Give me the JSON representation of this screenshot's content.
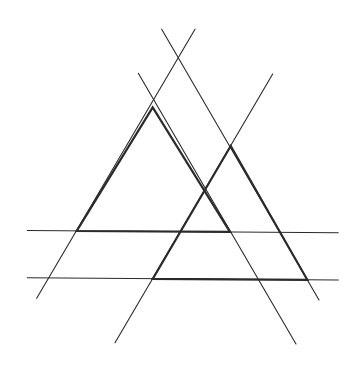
{
  "diagram": {
    "background": "#ffffff",
    "stroke_color": "#2b2b2b",
    "thin_width": 1.1,
    "thick_width": 2.2,
    "lines": [
      {
        "id": "line-a",
        "x1": 36.7,
        "y1": 298.3,
        "x2": 195,
        "y2": 29.3
      },
      {
        "id": "line-b",
        "x1": 138.3,
        "y1": 73.3,
        "x2": 296,
        "y2": 344
      },
      {
        "id": "line-c",
        "x1": 115,
        "y1": 342.7,
        "x2": 272.7,
        "y2": 74
      },
      {
        "id": "line-d",
        "x1": 161.7,
        "y1": 29.3,
        "x2": 319,
        "y2": 300
      },
      {
        "id": "horizontal-upper",
        "x1": 27.3,
        "y1": 230.5,
        "x2": 338.3,
        "y2": 232.7
      },
      {
        "id": "horizontal-lower",
        "x1": 27.3,
        "y1": 277.8,
        "x2": 338.3,
        "y2": 280
      }
    ],
    "triangles": [
      {
        "id": "left-triangle",
        "points": [
          [
            152.7,
            107.3
          ],
          [
            76.7,
            231
          ],
          [
            230,
            231.9
          ]
        ]
      },
      {
        "id": "right-triangle",
        "points": [
          [
            230.7,
            146
          ],
          [
            152.7,
            278.9
          ],
          [
            307.3,
            279.8
          ]
        ]
      }
    ]
  }
}
